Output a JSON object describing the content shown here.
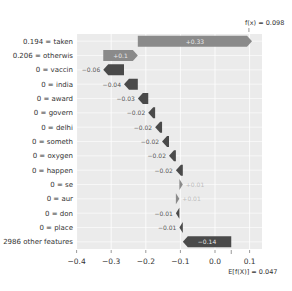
{
  "chart_data": {
    "type": "waterfall",
    "title": "",
    "base_value": 0.047,
    "base_label": "E[f(X)] = 0.047",
    "output_value": 0.098,
    "output_label": "f(x) = 0.098",
    "features": [
      {
        "label": "0.194 = taken",
        "value": 0.33,
        "text": "+0.33"
      },
      {
        "label": "0.206 = otherwis",
        "value": 0.1,
        "text": "+0.1"
      },
      {
        "label": "0 = vaccin",
        "value": -0.06,
        "text": "−0.06"
      },
      {
        "label": "0 = india",
        "value": -0.04,
        "text": "−0.04"
      },
      {
        "label": "0 = award",
        "value": -0.03,
        "text": "−0.03"
      },
      {
        "label": "0 = govern",
        "value": -0.02,
        "text": "−0.02"
      },
      {
        "label": "0 = delhi",
        "value": -0.02,
        "text": "−0.02"
      },
      {
        "label": "0 = someth",
        "value": -0.02,
        "text": "−0.02"
      },
      {
        "label": "0 = oxygen",
        "value": -0.02,
        "text": "−0.02"
      },
      {
        "label": "0 = happen",
        "value": -0.02,
        "text": "−0.02"
      },
      {
        "label": "0 = se",
        "value": 0.01,
        "text": "+0.01"
      },
      {
        "label": "0 = aur",
        "value": 0.01,
        "text": "+0.01"
      },
      {
        "label": "0 = don",
        "value": -0.01,
        "text": "−0.01"
      },
      {
        "label": "0 = place",
        "value": -0.01,
        "text": "−0.01"
      },
      {
        "label": "2986 other features",
        "value": -0.14,
        "text": "−0.14"
      }
    ],
    "xticks": [
      -0.4,
      -0.3,
      -0.2,
      -0.1,
      0.0,
      0.1
    ],
    "xtick_labels": [
      "−0.4",
      "−0.3",
      "−0.2",
      "−0.1",
      "0.0",
      "0.1"
    ],
    "xlim": [
      -0.4,
      0.145
    ],
    "grid": true,
    "xlabel": "",
    "ylabel": "",
    "colors": {
      "positive": "#8a8a8a",
      "negative": "#4a4a4a",
      "positive_text": "#bdbdbd",
      "negative_text": "#555555",
      "background": "#ebebeb",
      "grid": "#ffffff"
    }
  }
}
